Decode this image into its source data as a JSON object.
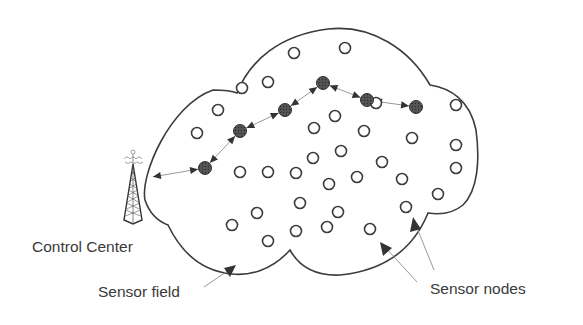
{
  "diagram": {
    "type": "wireless-sensor-network",
    "labels": {
      "control_center": "Control Center",
      "sensor_field": "Sensor field",
      "sensor_nodes": "Sensor nodes"
    },
    "colors": {
      "outline": "#3c3c3c",
      "node_stroke": "#3c3c3c",
      "active_node_fill": "#4a4a4a",
      "link": "#9a9a9a",
      "arrowhead": "#333333",
      "text": "#3a3a3a"
    },
    "sensor_nodes": [
      [
        294,
        53
      ],
      [
        345,
        48
      ],
      [
        242,
        88
      ],
      [
        268,
        82
      ],
      [
        218,
        110
      ],
      [
        376,
        103
      ],
      [
        197,
        133
      ],
      [
        456,
        105
      ],
      [
        314,
        128
      ],
      [
        335,
        116
      ],
      [
        364,
        131
      ],
      [
        313,
        158
      ],
      [
        341,
        151
      ],
      [
        412,
        138
      ],
      [
        456,
        145
      ],
      [
        240,
        172
      ],
      [
        268,
        172
      ],
      [
        382,
        162
      ],
      [
        456,
        168
      ],
      [
        296,
        173
      ],
      [
        329,
        184
      ],
      [
        357,
        177
      ],
      [
        402,
        179
      ],
      [
        438,
        194
      ],
      [
        257,
        213
      ],
      [
        300,
        203
      ],
      [
        338,
        212
      ],
      [
        406,
        207
      ],
      [
        232,
        225
      ],
      [
        268,
        241
      ],
      [
        296,
        231
      ],
      [
        327,
        227
      ],
      [
        370,
        229
      ]
    ],
    "relay_path": [
      [
        205,
        168
      ],
      [
        240,
        131
      ],
      [
        285,
        110
      ],
      [
        323,
        83
      ],
      [
        367,
        100
      ],
      [
        416,
        107
      ]
    ],
    "control_center": {
      "x": 133,
      "y": 185
    }
  }
}
